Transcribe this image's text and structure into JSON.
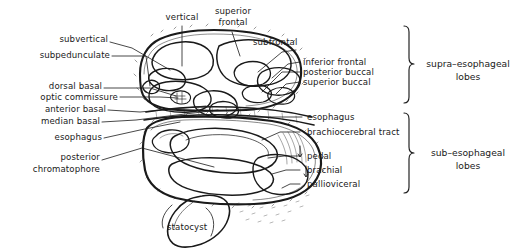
{
  "figure": {
    "background_color": "#ffffff",
    "ink_color": "#1a1a1a"
  },
  "labels_left": [
    {
      "name": "subvertical",
      "text": "subvertical"
    },
    {
      "name": "subpedunculate",
      "text": "subpedunculate"
    },
    {
      "name": "dorsal-basal",
      "text": "dorsal  basal"
    },
    {
      "name": "optic-commissure",
      "text": "optic  commissure"
    },
    {
      "name": "anterior-basal",
      "text": "anterior basal"
    },
    {
      "name": "median-basal",
      "text": "median basal"
    },
    {
      "name": "esophagus-left",
      "text": "esophagus"
    },
    {
      "name": "posterior-chromatophore-line1",
      "text": "posterior"
    },
    {
      "name": "posterior-chromatophore-line2",
      "text": "chromatophore"
    }
  ],
  "labels_top": [
    {
      "name": "vertical",
      "text": "vertical"
    },
    {
      "name": "superior-frontal-line1",
      "text": "superior"
    },
    {
      "name": "superior-frontal-line2",
      "text": "frontal"
    }
  ],
  "labels_right": [
    {
      "name": "subfrontal",
      "text": "subfrontal"
    },
    {
      "name": "inferior-frontal",
      "text": "inferior frontal"
    },
    {
      "name": "posterior-buccal",
      "text": "posterior  buccal"
    },
    {
      "name": "superior-buccal",
      "text": "superior  buccal"
    },
    {
      "name": "esophagus-right",
      "text": "esophagus"
    },
    {
      "name": "brachiocerebral-tract",
      "text": "brachiocerebral  tract"
    },
    {
      "name": "pedal",
      "text": "pedal"
    },
    {
      "name": "brachial",
      "text": "brachial"
    },
    {
      "name": "pallioviceral",
      "text": "pallioviceral"
    }
  ],
  "labels_bottom": [
    {
      "name": "statocyst",
      "text": "statocyst"
    }
  ],
  "groups": [
    {
      "name": "supra-esophageal-lobes",
      "line1": "supra–esophageal",
      "line2": "lobes"
    },
    {
      "name": "sub-esophageal-lobes",
      "line1": "sub–esophageal",
      "line2": "lobes"
    }
  ]
}
